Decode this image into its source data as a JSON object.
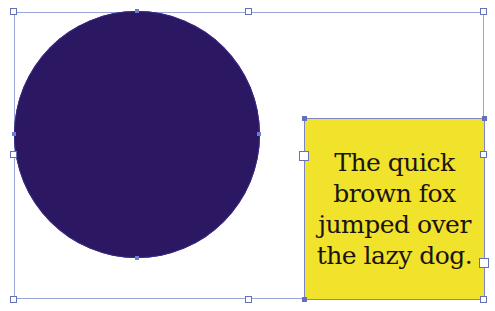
{
  "canvas": {
    "background": "#ffffff",
    "selection_color": "#9aa6d8"
  },
  "circle": {
    "fill": "#2b1762",
    "label": "Filled ellipse shape"
  },
  "text_frame": {
    "fill": "#f1e22c",
    "lines": [
      "The quick",
      "brown fox",
      "jumped over",
      "the lazy dog."
    ]
  }
}
